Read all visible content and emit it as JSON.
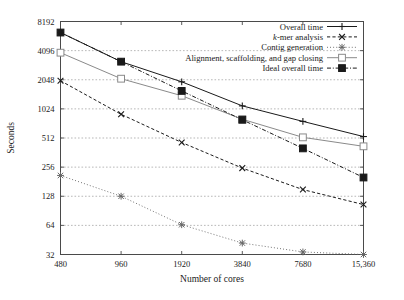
{
  "chart_data": {
    "type": "line",
    "title": "",
    "xlabel": "Number of cores",
    "ylabel": "Seconds",
    "x_tick_labels": [
      "480",
      "960",
      "1920",
      "3840",
      "7680",
      "15,360"
    ],
    "x_values": [
      480,
      960,
      1920,
      3840,
      7680,
      15360
    ],
    "x_scale": "log2",
    "y_scale": "log2",
    "y_tick_labels": [
      "32",
      "64",
      "128",
      "256",
      "512",
      "1024",
      "2048",
      "4096",
      "8192"
    ],
    "y_tick_values": [
      32,
      64,
      128,
      256,
      512,
      1024,
      2048,
      4096,
      8192
    ],
    "ylim": [
      32,
      8192
    ],
    "grid": true,
    "legend_position": "top-right",
    "series": [
      {
        "name": "Overall time",
        "marker": "plus",
        "line_style": "solid",
        "color": "#1a1a1a",
        "values": [
          6300,
          3150,
          1950,
          1100,
          760,
          530
        ]
      },
      {
        "name": "k-mer analysis",
        "marker": "cross",
        "line_style": "dashed",
        "color": "#1a1a1a",
        "values": [
          2000,
          900,
          460,
          250,
          150,
          105
        ]
      },
      {
        "name": "Contig generation",
        "marker": "asterisk",
        "line_style": "dotted",
        "color": "#666666",
        "values": [
          210,
          128,
          65,
          42,
          34,
          32
        ]
      },
      {
        "name": "Alignment, scaffolding, and gap closing",
        "marker": "open-square",
        "line_style": "solid",
        "color": "#8a8a8a",
        "values": [
          3900,
          2100,
          1400,
          800,
          520,
          420
        ]
      },
      {
        "name": "Ideal overall time",
        "marker": "filled-square",
        "line_style": "dashdot",
        "color": "#1a1a1a",
        "values": [
          6300,
          3150,
          1570,
          790,
          400,
          200
        ]
      }
    ]
  },
  "legend": {
    "items": [
      {
        "label_prefix": "",
        "label_italic": "",
        "label_rest": "Overall time"
      },
      {
        "label_prefix": "",
        "label_italic": "k",
        "label_rest": "-mer analysis"
      },
      {
        "label_prefix": "",
        "label_italic": "",
        "label_rest": "Contig generation"
      },
      {
        "label_prefix": "",
        "label_italic": "",
        "label_rest": "Alignment, scaffolding, and gap closing"
      },
      {
        "label_prefix": "",
        "label_italic": "",
        "label_rest": "Ideal overall time"
      }
    ]
  },
  "colors": {
    "axis": "#4a4a4a",
    "grid": "#9a9a9a",
    "text": "#1a1a1a"
  }
}
